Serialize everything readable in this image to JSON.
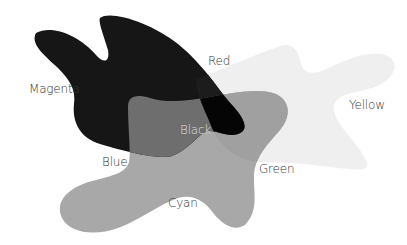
{
  "diagram": {
    "type": "color-mixing-venn",
    "shapes": [
      {
        "name": "yellow",
        "fill": "#efefef"
      },
      {
        "name": "cyan",
        "fill": "#a8a8a8"
      },
      {
        "name": "magenta",
        "fill": "#161616"
      }
    ],
    "overlap_fills": {
      "blue": "#6e6e6e",
      "black": "#050505",
      "green": "#a0a0a0",
      "red": "#1a1a1a"
    },
    "labels": {
      "magenta": {
        "text": "Magenta",
        "color": "#333333"
      },
      "red": {
        "text": "Red",
        "color": "#333333"
      },
      "yellow": {
        "text": "Yellow",
        "color": "#333333"
      },
      "black": {
        "text": "Black",
        "color": "#dddddd"
      },
      "blue": {
        "text": "Blue",
        "color": "#333333"
      },
      "green": {
        "text": "Green",
        "color": "#333333"
      },
      "cyan": {
        "text": "Cyan",
        "color": "#333333"
      }
    }
  }
}
